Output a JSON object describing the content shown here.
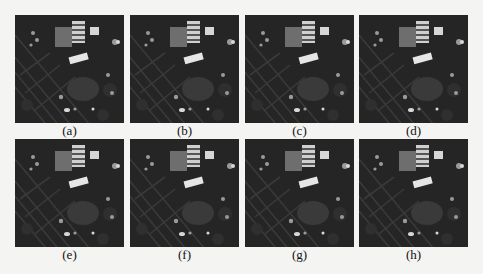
{
  "figure": {
    "panels": [
      {
        "id": "a",
        "label": "(a)",
        "row": 0,
        "col": 0
      },
      {
        "id": "b",
        "label": "(b)",
        "row": 0,
        "col": 1
      },
      {
        "id": "c",
        "label": "(c)",
        "row": 0,
        "col": 2
      },
      {
        "id": "d",
        "label": "(d)",
        "row": 0,
        "col": 3
      },
      {
        "id": "e",
        "label": "(e)",
        "row": 1,
        "col": 0
      },
      {
        "id": "f",
        "label": "(f)",
        "row": 1,
        "col": 1
      },
      {
        "id": "g",
        "label": "(g)",
        "row": 1,
        "col": 2
      },
      {
        "id": "h",
        "label": "(h)",
        "row": 1,
        "col": 3
      }
    ],
    "content": "aerial satellite image of urban area with buildings and diagonal roads",
    "colors": {
      "background": "#f4f4f2",
      "image_dark": "#262626",
      "roof_gray": "#6e6e6e",
      "highlight": "#e8e8e8"
    }
  }
}
